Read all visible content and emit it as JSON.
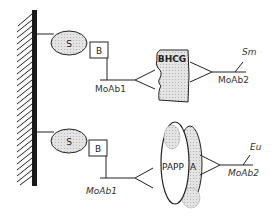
{
  "diagram": {
    "colors": {
      "stroke": "#222222",
      "wall": "#1a1a1a",
      "shade": "#d8d8d8",
      "background": "#ffffff"
    },
    "top_assay": {
      "solid_phase_label": "S",
      "biotin_label": "B",
      "capture_antibody_label": "MoAb1",
      "analyte_label": "BHCG",
      "detection_antibody_label": "MoAb2",
      "tag_label": "Sm"
    },
    "bottom_assay": {
      "solid_phase_label": "S",
      "biotin_label": "B",
      "capture_antibody_label": "MoAb1",
      "analyte_label_left": "PAPP",
      "analyte_label_right": "A",
      "detection_antibody_label": "MoAb2",
      "tag_label": "Eu"
    }
  }
}
